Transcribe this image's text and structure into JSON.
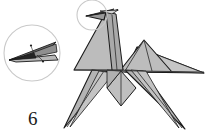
{
  "page": {
    "kind": "origami-instruction-step",
    "background_color": "#ffffff",
    "width": 208,
    "height": 136
  },
  "step": {
    "number": "6"
  },
  "colors": {
    "paper_fill": "#b8b8b8",
    "paper_fill_light": "#cfcfcf",
    "paper_fill_dark": "#9e9e9e",
    "paper_fill_white": "#f2f2f2",
    "outline": "#1a1a1a",
    "fold_line": "#3a3a3a",
    "callout_circle": "#c9c9c9",
    "marker_dot": "#222222"
  },
  "detail_callout": {
    "name": "magnified-beak-detail",
    "circle": {
      "cx": 32,
      "cy": 53,
      "r": 28
    },
    "marker_dots": [
      {
        "cx": 31,
        "cy": 46
      },
      {
        "cx": 43,
        "cy": 60
      }
    ],
    "leader_lines": [
      {
        "x1": 31,
        "y1": 46,
        "x2": 34,
        "y2": 53
      },
      {
        "x1": 43,
        "y1": 60,
        "x2": 38,
        "y2": 53
      }
    ]
  },
  "head_callout": {
    "name": "head-highlight-circle",
    "circle": {
      "cx": 92,
      "cy": 15,
      "r": 15
    }
  },
  "figure": {
    "name": "origami-horse",
    "parts": [
      {
        "id": "head-beak",
        "label": "head and beak"
      },
      {
        "id": "neck",
        "label": "neck"
      },
      {
        "id": "body",
        "label": "body"
      },
      {
        "id": "wing",
        "label": "wing"
      },
      {
        "id": "tail",
        "label": "tail"
      },
      {
        "id": "front-legs",
        "label": "front legs"
      },
      {
        "id": "rear-legs",
        "label": "rear legs"
      },
      {
        "id": "chest",
        "label": "chest"
      }
    ]
  }
}
